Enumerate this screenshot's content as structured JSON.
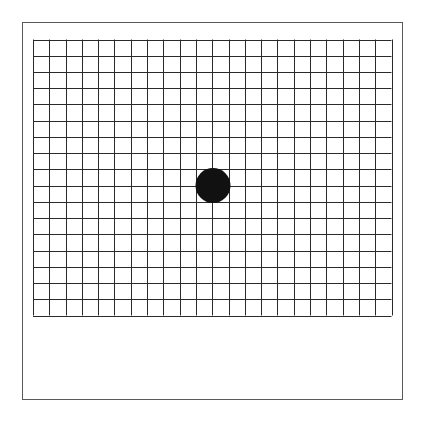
{
  "figure": {
    "type": "amsler-grid",
    "frame": {
      "x": 22,
      "y": 22,
      "width": 382,
      "height": 379,
      "stroke": "#5a5a5a"
    },
    "grid": {
      "x": 33,
      "y": 39.5,
      "width": 358.5,
      "height": 276,
      "columns": 22,
      "rows": 17,
      "line_color": "#2a2a2a",
      "line_width": 1
    },
    "fixation_dot": {
      "cx": 213,
      "cy": 185.5,
      "r": 17.5,
      "color": "#111111"
    }
  }
}
